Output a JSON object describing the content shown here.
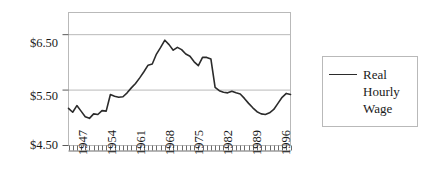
{
  "chart_data": {
    "type": "line",
    "title": "",
    "subtitle": "",
    "xlabel": "",
    "ylabel": "",
    "xlim": [
      1947,
      2000
    ],
    "ylim": [
      4.5,
      6.9
    ],
    "yticks": [
      "$4.50",
      "$5.50",
      "$6.50"
    ],
    "ytick_values": [
      4.5,
      5.5,
      6.5
    ],
    "xticks": [
      "1947",
      "1954",
      "1961",
      "1968",
      "1975",
      "1982",
      "1989",
      "1996"
    ],
    "xtick_values": [
      1947,
      1954,
      1961,
      1968,
      1975,
      1982,
      1989,
      1996
    ],
    "grid": "horizontal",
    "legend_position": "right",
    "line_color": "#2b2b2b",
    "frame_color": "#b9b9b9",
    "grid_color": "#b9b9b9",
    "series": [
      {
        "name": "Real Hourly Wage",
        "x": [
          1947,
          1948,
          1949,
          1950,
          1951,
          1952,
          1953,
          1954,
          1955,
          1956,
          1957,
          1958,
          1959,
          1960,
          1961,
          1962,
          1963,
          1964,
          1965,
          1966,
          1967,
          1968,
          1969,
          1970,
          1971,
          1972,
          1973,
          1974,
          1975,
          1976,
          1977,
          1978,
          1979,
          1980,
          1981,
          1982,
          1983,
          1984,
          1985,
          1986,
          1987,
          1988,
          1989,
          1990,
          1991,
          1992,
          1993,
          1994,
          1995,
          1996,
          1997,
          1998,
          1999,
          2000
        ],
        "values": [
          5.17,
          5.1,
          5.22,
          5.12,
          5.02,
          4.99,
          5.07,
          5.06,
          5.13,
          5.12,
          5.42,
          5.39,
          5.37,
          5.38,
          5.45,
          5.54,
          5.62,
          5.72,
          5.83,
          5.95,
          5.97,
          6.15,
          6.27,
          6.4,
          6.32,
          6.22,
          6.27,
          6.23,
          6.15,
          6.11,
          6.01,
          5.94,
          6.09,
          6.09,
          6.06,
          5.55,
          5.49,
          5.46,
          5.45,
          5.48,
          5.45,
          5.43,
          5.35,
          5.26,
          5.18,
          5.11,
          5.07,
          5.06,
          5.09,
          5.15,
          5.26,
          5.37,
          5.44,
          5.42
        ]
      }
    ]
  },
  "legend": {
    "entry_label": "Real Hourly Wage",
    "line_swatch": "line-swatch"
  },
  "axes": {
    "y_axis_name": "dollar-axis",
    "x_axis_name": "year-axis"
  }
}
